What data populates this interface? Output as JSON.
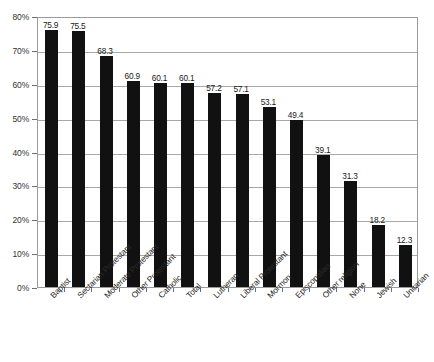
{
  "chart_data": {
    "type": "bar",
    "title": "",
    "xlabel": "",
    "ylabel": "",
    "ylim": [
      0,
      80
    ],
    "ytick_labels": [
      "80%",
      "70%",
      "60%",
      "50%",
      "40%",
      "30%",
      "20%",
      "10%",
      "0%"
    ],
    "ytick_values": [
      80,
      70,
      60,
      50,
      40,
      30,
      20,
      10,
      0
    ],
    "grid": true,
    "legend": "none",
    "bar_color": "#111111",
    "gridline_color": "#a8a8a8",
    "categories": [
      "Baptist",
      "Sectarian Protestant",
      "Moderate Protestant",
      "Other Protestant",
      "Catholic",
      "Total",
      "Lutheran",
      "Liberal Protestant",
      "Mormon",
      "Episcopalian",
      "Other religion",
      "None",
      "Jewish",
      "Unitarian"
    ],
    "values": [
      75.9,
      75.5,
      68.3,
      60.9,
      60.1,
      60.1,
      57.2,
      57.1,
      53.1,
      49.4,
      39.1,
      31.3,
      18.2,
      12.3
    ],
    "value_labels": [
      "75.9",
      "75.5",
      "68.3",
      "60.9",
      "60.1",
      "60.1",
      "57.2",
      "57.1",
      "53.1",
      "49.4",
      "39.1",
      "31.3",
      "18.2",
      "12.3"
    ]
  }
}
